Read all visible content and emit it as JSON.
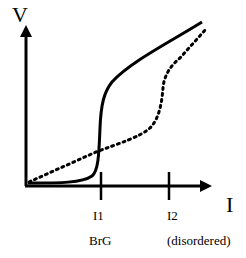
{
  "diagram": {
    "y_axis_label": "V",
    "x_axis_label": "I",
    "ticks": [
      {
        "label": "I1",
        "sublabel": "BrG"
      },
      {
        "label": "I2",
        "sublabel": "(disordered)"
      }
    ],
    "curves": [
      {
        "name": "solid-curve",
        "style": "solid"
      },
      {
        "name": "dotted-curve",
        "style": "dotted"
      }
    ],
    "colors": {
      "line": "#000000",
      "background": "#ffffff"
    }
  }
}
